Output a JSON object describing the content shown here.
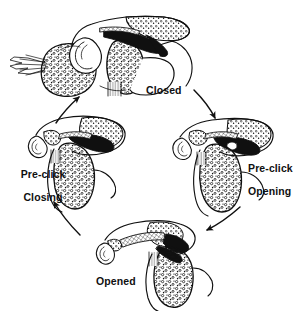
{
  "figure": {
    "type": "anatomical-line-diagram",
    "background_color": "#ffffff",
    "ink_color": "#101010",
    "stage_count": 4,
    "cycle_direction": "clockwise"
  },
  "stages": [
    {
      "id": "closed",
      "label": "Closed",
      "position": "top",
      "label_x": 146,
      "label_y": 85
    },
    {
      "id": "pre-click-opening",
      "label": "Pre-click\nOpening",
      "label_line1": "Pre-click",
      "label_line2": "Opening",
      "position": "right",
      "label_x": 236,
      "label_y": 151
    },
    {
      "id": "opened",
      "label": "Opened",
      "position": "bottom",
      "label_x": 96,
      "label_y": 276
    },
    {
      "id": "pre-click-closing",
      "label": "Pre-click\nClosing",
      "label_line1": "Pre-click",
      "label_line2": "Closing",
      "position": "left",
      "label_x": 6,
      "label_y": 157
    }
  ],
  "arrows": [
    {
      "id": "arrow-closed-to-opening",
      "from": "closed",
      "to": "pre-click-opening",
      "direction": "down-right"
    },
    {
      "id": "arrow-opening-to-opened",
      "from": "pre-click-opening",
      "to": "opened",
      "direction": "down-left"
    },
    {
      "id": "arrow-opened-to-closing",
      "from": "opened",
      "to": "pre-click-closing",
      "direction": "up-left"
    },
    {
      "id": "arrow-closing-to-closed",
      "from": "pre-click-closing",
      "to": "closed",
      "direction": "up-right"
    }
  ]
}
